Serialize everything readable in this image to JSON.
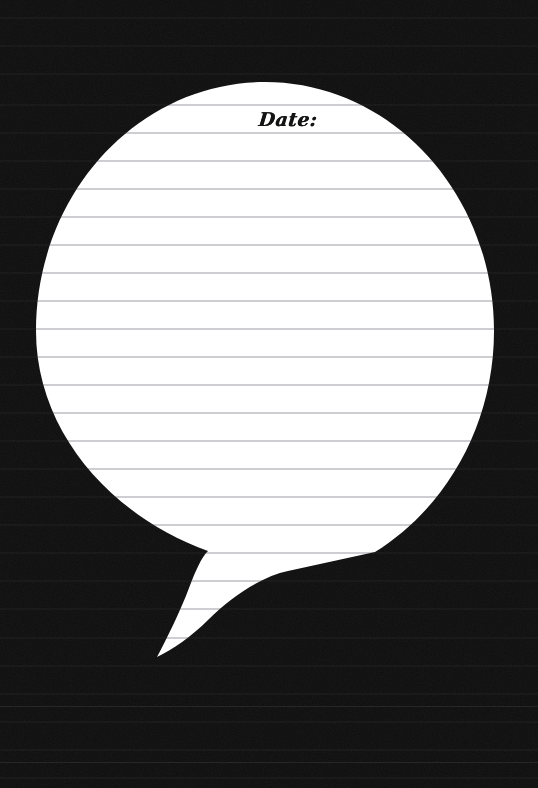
{
  "page": {
    "width": 538,
    "height": 788,
    "background_color": "#0d0d0d",
    "paper_color": "#ffffff",
    "rule_color": "#9a9aa2",
    "ink_color": "#141414"
  },
  "caption": {
    "date_label": "Date:"
  },
  "balloon": {
    "shape_name": "speech-balloon",
    "center_x": 265,
    "center_y": 331,
    "radius_x": 229,
    "radius_y": 249,
    "top_y": 82,
    "bottom_y": 580,
    "left_x": 36,
    "right_x": 494,
    "tail_tip_x": 157,
    "tail_tip_y": 657
  },
  "ruled_lines": {
    "spacing_px": 28.05,
    "first_line_y": 104,
    "thickness_px": 1,
    "count": 24,
    "color": "#9a9aa2"
  },
  "stray_rules": [
    {
      "y": 706
    },
    {
      "y": 762
    }
  ]
}
